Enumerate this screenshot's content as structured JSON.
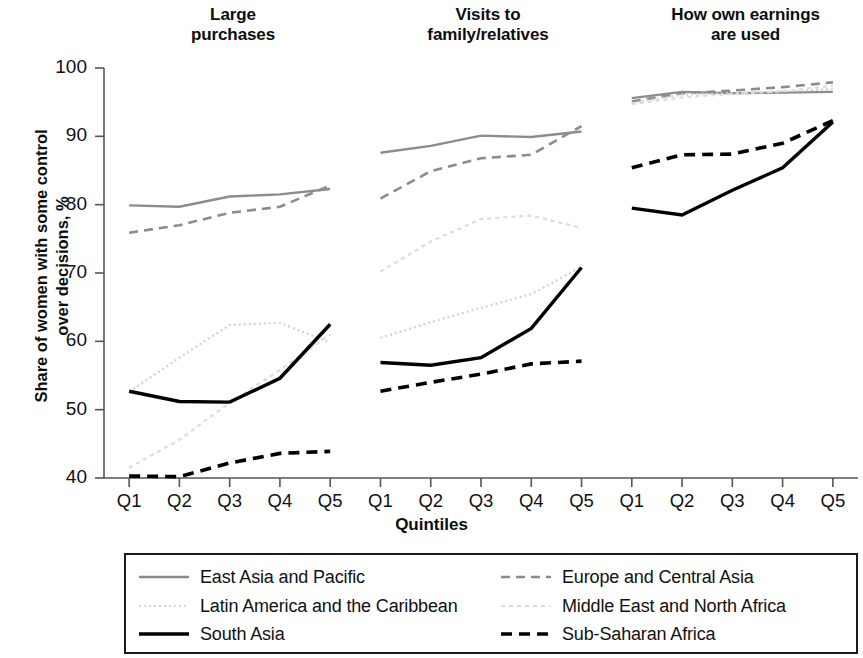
{
  "chart_data": {
    "type": "line",
    "title": "",
    "xlabel": "Quintiles",
    "ylabel": "Share of women with some control over decisions, %",
    "ylabel_line1": "Share of women with some control",
    "ylabel_line2": "over decisions, %",
    "ylim": [
      40,
      100
    ],
    "yticks": [
      40,
      50,
      60,
      70,
      80,
      90,
      100
    ],
    "grid": false,
    "legend_position": "bottom",
    "categories": [
      "Q1",
      "Q2",
      "Q3",
      "Q4",
      "Q5"
    ],
    "panels": [
      {
        "title": "Large purchases",
        "title_line1": "Large",
        "title_line2": "purchases",
        "xticks": [
          "Q1",
          "Q2",
          "Q3",
          "Q4",
          "Q5"
        ],
        "series": [
          {
            "name": "East Asia and Pacific",
            "values": [
              79.9,
              79.7,
              81.2,
              81.5,
              82.3
            ]
          },
          {
            "name": "Europe and Central Asia",
            "values": [
              75.9,
              77.0,
              78.8,
              79.7,
              82.8
            ]
          },
          {
            "name": "Latin America and the Caribbean",
            "values": [
              52.6,
              57.6,
              62.4,
              62.7,
              59.8
            ]
          },
          {
            "name": "Middle East and North Africa",
            "values": [
              41.5,
              45.6,
              51.0,
              55.8,
              61.0
            ]
          },
          {
            "name": "South Asia",
            "values": [
              52.7,
              51.2,
              51.1,
              54.6,
              62.5
            ]
          },
          {
            "name": "Sub-Saharan Africa",
            "values": [
              40.3,
              40.2,
              42.2,
              43.6,
              43.9
            ]
          }
        ]
      },
      {
        "title": "Visits to family/relatives",
        "title_line1": "Visits to",
        "title_line2": "family/relatives",
        "xticks": [
          "Q1",
          "Q2",
          "Q3",
          "Q4",
          "Q5"
        ],
        "series": [
          {
            "name": "East Asia and Pacific",
            "values": [
              87.6,
              88.6,
              90.1,
              89.9,
              90.7
            ]
          },
          {
            "name": "Europe and Central Asia",
            "values": [
              80.9,
              84.9,
              86.8,
              87.3,
              91.5
            ]
          },
          {
            "name": "Latin America and the Caribbean",
            "values": [
              60.5,
              62.8,
              64.9,
              66.9,
              70.9
            ]
          },
          {
            "name": "Middle East and North Africa",
            "values": [
              70.2,
              74.6,
              77.9,
              78.4,
              76.6
            ]
          },
          {
            "name": "South Asia",
            "values": [
              56.9,
              56.5,
              57.6,
              61.9,
              70.8
            ]
          },
          {
            "name": "Sub-Saharan Africa",
            "values": [
              52.7,
              54.0,
              55.2,
              56.7,
              57.1
            ]
          }
        ]
      },
      {
        "title": "How own earnings are used",
        "title_line1": "How own earnings",
        "title_line2": "are used",
        "xticks": [
          "Q1",
          "Q2",
          "Q3",
          "Q4",
          "Q5"
        ],
        "series": [
          {
            "name": "East Asia and Pacific",
            "values": [
              95.6,
              96.5,
              96.3,
              96.4,
              96.5
            ]
          },
          {
            "name": "Europe and Central Asia",
            "values": [
              95.1,
              96.3,
              96.7,
              97.2,
              97.9
            ]
          },
          {
            "name": "Latin America and the Caribbean",
            "values": [
              94.9,
              96.1,
              96.3,
              96.6,
              96.9
            ]
          },
          {
            "name": "Middle East and North Africa",
            "values": [
              94.7,
              95.7,
              96.2,
              96.6,
              97.4
            ]
          },
          {
            "name": "South Asia",
            "values": [
              79.5,
              78.5,
              82.1,
              85.4,
              92.1
            ]
          },
          {
            "name": "Sub-Saharan Africa",
            "values": [
              85.4,
              87.3,
              87.4,
              89.0,
              92.3
            ]
          }
        ]
      }
    ],
    "legend": [
      {
        "name": "East Asia and Pacific",
        "style": "solid-gray",
        "color": "#8c8c8c",
        "width": 2.4,
        "dash": "none"
      },
      {
        "name": "Europe and Central Asia",
        "style": "dashed-gray",
        "color": "#8c8c8c",
        "width": 2.6,
        "dash": "9,6"
      },
      {
        "name": "Latin America and the Caribbean",
        "style": "dotted-light",
        "color": "#d2d2d2",
        "width": 2.2,
        "dash": "2,3"
      },
      {
        "name": "Middle East and North Africa",
        "style": "dotted-lighter",
        "color": "#dcdcdc",
        "width": 2.2,
        "dash": "4,4"
      },
      {
        "name": "South Asia",
        "style": "solid-black",
        "color": "#000000",
        "width": 3.4,
        "dash": "none"
      },
      {
        "name": "Sub-Saharan Africa",
        "style": "dashed-black",
        "color": "#000000",
        "width": 3.6,
        "dash": "11,7"
      }
    ],
    "colors": {
      "east_asia": "#8c8c8c",
      "europe": "#8c8c8c",
      "latin_america": "#d2d2d2",
      "middle_east": "#dcdcdc",
      "south_asia": "#000000",
      "sub_saharan": "#000000",
      "axis": "#555555",
      "text": "#111111"
    }
  }
}
